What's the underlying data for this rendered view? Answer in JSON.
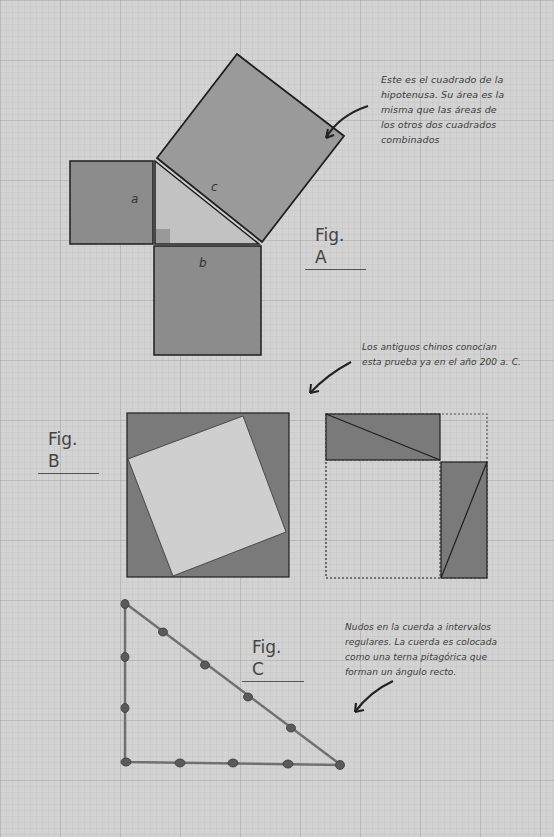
{
  "colors": {
    "background": "#d3d3d3",
    "square_fill": "#8c8c8c",
    "hyp_square_fill": "#9a9a9a",
    "triangle_fill": "#c2c2c2",
    "dark_fill": "#7a7a7a",
    "inner_fill": "#cfcfcf",
    "stroke": "#1e1e1e",
    "rope": "#6e6e6e"
  },
  "fig_a": {
    "label": "Fig. A",
    "side_a": "a",
    "side_b": "b",
    "side_c": "c",
    "note": [
      "Este es el cuadrado de la",
      "hipotenusa. Su área es la",
      "misma que las áreas de",
      "los otros dos cuadrados",
      "combinados"
    ]
  },
  "fig_b": {
    "label": "Fig. B",
    "note": [
      "Los antiguos chinos conocían",
      "esta prueba ya en el año 200 a. C."
    ]
  },
  "fig_c": {
    "label": "Fig. C",
    "note": [
      "Nudos en la cuerda a intervalos",
      "regulares. La cuerda es colocada",
      "como una terna pitagórica que",
      "forman un ángulo recto."
    ],
    "knots_vertical": 3,
    "knots_horizontal": 4,
    "knots_hypotenuse": 5
  }
}
